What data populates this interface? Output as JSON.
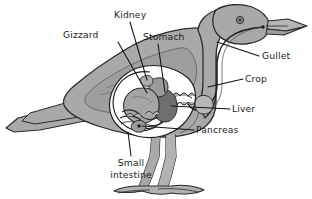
{
  "diagram": {
    "title": "",
    "background_color": "#ffffff",
    "line_color": "#111111",
    "text_color": "#1c1c1c",
    "body_fill": "#a9a9a9",
    "body_fill_light": "#c0c0c0",
    "organ_fill": "#8c8c8c",
    "organ_fill_dark": "#6e6e6e",
    "organ_fill_light": "#bdbdbd",
    "cavity_fill": "#ffffff",
    "labels": [
      {
        "id": "gizzard",
        "text": "Gizzard",
        "text_x": 63,
        "text_y": 38,
        "anchor": "start",
        "leader": "M 118 42 L 147 93",
        "lines": [
          "Gizzard"
        ]
      },
      {
        "id": "kidney",
        "text": "Kidney",
        "text_x": 114,
        "text_y": 18,
        "anchor": "start",
        "leader": "M 130 22 L 147 80",
        "lines": [
          "Kidney"
        ]
      },
      {
        "id": "stomach",
        "text": "Stomach",
        "text_x": 143,
        "text_y": 40,
        "anchor": "start",
        "leader": "M 158 44 L 165 92",
        "lines": [
          "Stomach"
        ]
      },
      {
        "id": "gullet",
        "text": "Gullet",
        "text_x": 262,
        "text_y": 59,
        "anchor": "start",
        "leader": "M 259 56 L 217 42",
        "lines": [
          "Gullet"
        ]
      },
      {
        "id": "crop",
        "text": "Crop",
        "text_x": 245,
        "text_y": 82,
        "anchor": "start",
        "leader": "M 243 79 L 208 87",
        "lines": [
          "Crop"
        ]
      },
      {
        "id": "liver",
        "text": "Liver",
        "text_x": 232,
        "text_y": 112,
        "anchor": "start",
        "leader": "M 230 109 L 171 106",
        "lines": [
          "Liver"
        ]
      },
      {
        "id": "pancreas",
        "text": "Pancreas",
        "text_x": 196,
        "text_y": 133,
        "anchor": "start",
        "leader": "M 194 130 L 142 126",
        "lines": [
          "Pancreas"
        ]
      },
      {
        "id": "small-intestine",
        "text": "Small intestine",
        "text_x": 131,
        "text_y": 166,
        "anchor": "middle",
        "leader": "M 131 156 L 128 132",
        "lines": [
          "Small",
          "intestine"
        ]
      }
    ]
  }
}
